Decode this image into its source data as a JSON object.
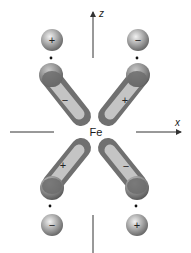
{
  "diagram": {
    "center_label": "Fe",
    "axes": {
      "z_label": "z",
      "x_label": "x"
    },
    "ligands": [
      {
        "position": "top-left",
        "sign": "+"
      },
      {
        "position": "top-right",
        "sign": "−"
      },
      {
        "position": "bottom-left",
        "sign": "−"
      },
      {
        "position": "bottom-right",
        "sign": "+"
      }
    ],
    "d_orbital_lobes": [
      {
        "position": "top-left",
        "sign": "−"
      },
      {
        "position": "top-right",
        "sign": "+"
      },
      {
        "position": "bottom-left",
        "sign": "+"
      },
      {
        "position": "bottom-right",
        "sign": "−"
      }
    ],
    "colors": {
      "sphere_light": "#e6e6e6",
      "sphere_dark": "#6e6e6e",
      "lobe_body": "#8a8a8a",
      "lobe_inner": "#cfcfcf",
      "lobe_head": "#6a6a6a",
      "axis": "#333333"
    }
  }
}
